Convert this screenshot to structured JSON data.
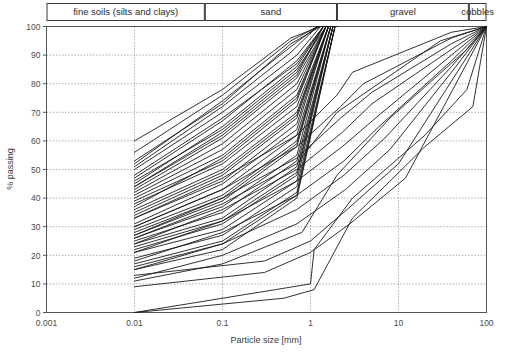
{
  "chart_data": {
    "type": "line",
    "title": "",
    "subtitle": "",
    "xlabel": "Particle size [mm]",
    "ylabel": "% passing",
    "xscale": "log",
    "xlim": [
      0.001,
      100
    ],
    "ylim": [
      0,
      100
    ],
    "xticks": [
      "0.001",
      "0.01",
      "0.1",
      "1",
      "10",
      "100"
    ],
    "xtick_values": [
      0.001,
      0.01,
      0.1,
      1,
      10,
      100
    ],
    "yticks": [
      "0",
      "10",
      "20",
      "30",
      "40",
      "50",
      "60",
      "70",
      "80",
      "90",
      "100"
    ],
    "ytick_values": [
      0,
      10,
      20,
      30,
      40,
      50,
      60,
      70,
      80,
      90,
      100
    ],
    "grid": "dotted-both",
    "legend": "none",
    "line_color": "#1a1a1a",
    "grid_color": "#9a9a9a",
    "axis_color": "#555555",
    "classification_bands": [
      {
        "label": "fine soils (silts and clays)",
        "x_start": 0.001,
        "x_end": 0.063
      },
      {
        "label": "sand",
        "x_start": 0.063,
        "x_end": 2.0
      },
      {
        "label": "gravel",
        "x_start": 2.0,
        "x_end": 63.0
      },
      {
        "label": "cobbles",
        "x_start": 63.0,
        "x_end": 200.0
      }
    ],
    "series": [
      {
        "name": "sample-01",
        "x": [
          0.01,
          0.1,
          0.6,
          1.3,
          2.0
        ],
        "y": [
          60,
          78,
          96,
          100,
          100
        ]
      },
      {
        "name": "sample-02",
        "x": [
          0.01,
          0.1,
          0.6,
          1.2,
          2.0
        ],
        "y": [
          52,
          74,
          93,
          100,
          100
        ]
      },
      {
        "name": "sample-03",
        "x": [
          0.01,
          0.1,
          0.6,
          1.2,
          2.0
        ],
        "y": [
          51,
          72,
          91,
          100,
          100
        ]
      },
      {
        "name": "sample-04",
        "x": [
          0.01,
          0.1,
          0.7,
          1.3,
          2.0
        ],
        "y": [
          50,
          70,
          90,
          100,
          100
        ]
      },
      {
        "name": "sample-05",
        "x": [
          0.01,
          0.1,
          0.7,
          1.4,
          2.0
        ],
        "y": [
          47,
          67,
          88,
          100,
          100
        ]
      },
      {
        "name": "sample-06",
        "x": [
          0.01,
          0.1,
          0.7,
          1.4,
          2.0
        ],
        "y": [
          45,
          65,
          86,
          100,
          100
        ]
      },
      {
        "name": "sample-07",
        "x": [
          0.01,
          0.1,
          0.7,
          1.4,
          2.0
        ],
        "y": [
          44,
          63,
          84,
          100,
          100
        ]
      },
      {
        "name": "sample-08",
        "x": [
          0.01,
          0.1,
          0.7,
          1.5,
          2.0
        ],
        "y": [
          43,
          61,
          82,
          100,
          100
        ]
      },
      {
        "name": "sample-09",
        "x": [
          0.01,
          0.1,
          0.7,
          1.5,
          2.0
        ],
        "y": [
          42,
          59,
          80,
          100,
          100
        ]
      },
      {
        "name": "sample-10",
        "x": [
          0.01,
          0.1,
          0.7,
          1.5,
          2.0
        ],
        "y": [
          41,
          57,
          78,
          100,
          100
        ]
      },
      {
        "name": "sample-11",
        "x": [
          0.01,
          0.1,
          0.7,
          1.5,
          2.0
        ],
        "y": [
          40,
          55,
          76,
          100,
          100
        ]
      },
      {
        "name": "sample-12",
        "x": [
          0.01,
          0.1,
          0.7,
          1.5,
          2.0
        ],
        "y": [
          39,
          53,
          74,
          100,
          100
        ]
      },
      {
        "name": "sample-13",
        "x": [
          0.01,
          0.1,
          0.7,
          1.6,
          2.0
        ],
        "y": [
          38,
          52,
          72,
          100,
          100
        ]
      },
      {
        "name": "sample-14",
        "x": [
          0.01,
          0.1,
          0.7,
          1.6,
          2.0
        ],
        "y": [
          36,
          50,
          70,
          100,
          100
        ]
      },
      {
        "name": "sample-15",
        "x": [
          0.01,
          0.1,
          0.7,
          1.6,
          2.0
        ],
        "y": [
          34,
          48,
          68,
          100,
          100
        ]
      },
      {
        "name": "sample-16",
        "x": [
          0.01,
          0.1,
          0.7,
          1.6,
          2.0
        ],
        "y": [
          33,
          46,
          66,
          100,
          100
        ]
      },
      {
        "name": "sample-17",
        "x": [
          0.01,
          0.1,
          0.7,
          1.6,
          2.0
        ],
        "y": [
          31,
          45,
          64,
          100,
          100
        ]
      },
      {
        "name": "sample-18",
        "x": [
          0.01,
          0.1,
          0.7,
          1.7,
          2.0
        ],
        "y": [
          30,
          43,
          62,
          100,
          100
        ]
      },
      {
        "name": "sample-19",
        "x": [
          0.01,
          0.1,
          0.7,
          1.7,
          2.0
        ],
        "y": [
          29,
          41,
          60,
          100,
          100
        ]
      },
      {
        "name": "sample-20",
        "x": [
          0.01,
          0.1,
          0.7,
          1.7,
          2.0
        ],
        "y": [
          27,
          39,
          58,
          100,
          100
        ]
      },
      {
        "name": "sample-21",
        "x": [
          0.01,
          0.1,
          0.7,
          1.7,
          2.0
        ],
        "y": [
          26,
          37,
          55,
          100,
          100
        ]
      },
      {
        "name": "sample-22",
        "x": [
          0.01,
          0.1,
          0.7,
          1.8,
          2.0
        ],
        "y": [
          25,
          35,
          53,
          100,
          100
        ]
      },
      {
        "name": "sample-23",
        "x": [
          0.01,
          0.1,
          0.7,
          1.8,
          2.0
        ],
        "y": [
          24,
          33,
          51,
          100,
          100
        ]
      },
      {
        "name": "sample-24",
        "x": [
          0.01,
          0.1,
          0.7,
          1.8,
          2.0
        ],
        "y": [
          22,
          31,
          48,
          100,
          100
        ]
      },
      {
        "name": "sample-25",
        "x": [
          0.01,
          0.1,
          0.7,
          1.8,
          2.0
        ],
        "y": [
          21,
          29,
          46,
          100,
          100
        ]
      },
      {
        "name": "sample-26",
        "x": [
          0.01,
          0.1,
          0.7,
          1.9,
          2.0
        ],
        "y": [
          19,
          27,
          44,
          100,
          100
        ]
      },
      {
        "name": "sample-27",
        "x": [
          0.01,
          0.1,
          0.7,
          1.9,
          2.0
        ],
        "y": [
          17,
          25,
          42,
          100,
          100
        ]
      },
      {
        "name": "sample-28",
        "x": [
          0.01,
          0.1,
          0.7,
          1.9,
          2.0
        ],
        "y": [
          15,
          22,
          40,
          100,
          100
        ]
      },
      {
        "name": "sample-29",
        "x": [
          0.01,
          0.1,
          0.7,
          2.0,
          3.0,
          40.0,
          100.0
        ],
        "y": [
          33,
          47,
          62,
          76,
          84,
          98,
          100
        ]
      },
      {
        "name": "sample-30",
        "x": [
          0.01,
          0.1,
          0.7,
          2.2,
          4.0,
          40.0,
          100.0
        ],
        "y": [
          30,
          43,
          58,
          72,
          80,
          96,
          100
        ]
      },
      {
        "name": "sample-31",
        "x": [
          0.01,
          0.1,
          0.7,
          2.2,
          5.0,
          40.0,
          100.0
        ],
        "y": [
          27,
          40,
          54,
          68,
          77,
          94,
          100
        ]
      },
      {
        "name": "sample-32",
        "x": [
          0.01,
          0.1,
          0.7,
          2.3,
          5.0,
          40.0,
          100.0
        ],
        "y": [
          24,
          36,
          50,
          63,
          73,
          92,
          100
        ]
      },
      {
        "name": "sample-33",
        "x": [
          0.01,
          0.1,
          0.7,
          2.3,
          6.0,
          40.0,
          100.0
        ],
        "y": [
          21,
          32,
          46,
          58,
          69,
          90,
          100
        ]
      },
      {
        "name": "sample-34",
        "x": [
          0.01,
          0.1,
          0.7,
          2.4,
          6.0,
          40.0,
          100.0
        ],
        "y": [
          18,
          28,
          41,
          53,
          65,
          88,
          100
        ]
      },
      {
        "name": "sample-35",
        "x": [
          0.01,
          0.1,
          0.7,
          2.4,
          7.0,
          40.0,
          100.0
        ],
        "y": [
          15,
          24,
          36,
          48,
          61,
          86,
          100
        ]
      },
      {
        "name": "sample-36",
        "x": [
          0.01,
          0.1,
          0.7,
          2.5,
          8.0,
          40.0,
          100.0
        ],
        "y": [
          12,
          20,
          31,
          43,
          57,
          84,
          100
        ]
      },
      {
        "name": "sample-37",
        "x": [
          0.01,
          0.3,
          1.0,
          2.6,
          10.0,
          100.0
        ],
        "y": [
          13,
          18,
          25,
          36,
          52,
          100
        ]
      },
      {
        "name": "sample-38",
        "x": [
          0.01,
          0.3,
          1.0,
          2.8,
          12.0,
          100.0
        ],
        "y": [
          9,
          14,
          21,
          31,
          47,
          100
        ]
      },
      {
        "name": "sample-39",
        "x": [
          0.01,
          0.4,
          1.0,
          1.1,
          3.0,
          20.0,
          60.0,
          100.0
        ],
        "y": [
          0,
          8,
          10,
          22,
          40,
          62,
          78,
          100
        ]
      },
      {
        "name": "sample-40",
        "x": [
          0.01,
          0.5,
          1.1,
          3.0,
          20.0,
          70.0,
          100.0
        ],
        "y": [
          0,
          5,
          8,
          33,
          58,
          72,
          100
        ]
      },
      {
        "name": "sample-41",
        "x": [
          0.01,
          0.1,
          0.8,
          2.0,
          8.0,
          60.0,
          100.0
        ],
        "y": [
          11,
          17,
          28,
          48,
          68,
          92,
          100
        ]
      },
      {
        "name": "sample-42",
        "x": [
          0.01,
          0.1,
          0.7,
          1.6,
          2.0
        ],
        "y": [
          35,
          49,
          69,
          100,
          100
        ]
      },
      {
        "name": "sample-43",
        "x": [
          0.01,
          0.1,
          0.7,
          1.5,
          2.0
        ],
        "y": [
          46,
          64,
          85,
          100,
          100
        ]
      },
      {
        "name": "sample-44",
        "x": [
          0.01,
          0.1,
          0.6,
          1.3,
          2.0
        ],
        "y": [
          53,
          73,
          94,
          100,
          100
        ]
      },
      {
        "name": "sample-45",
        "x": [
          0.01,
          0.1,
          0.7,
          1.4,
          2.0
        ],
        "y": [
          48,
          68,
          87,
          100,
          100
        ]
      },
      {
        "name": "sample-46",
        "x": [
          0.01,
          0.1,
          0.7,
          1.7,
          2.0
        ],
        "y": [
          28,
          40,
          59,
          100,
          100
        ]
      },
      {
        "name": "sample-47",
        "x": [
          0.01,
          0.1,
          0.7,
          1.8,
          2.0
        ],
        "y": [
          23,
          32,
          49,
          100,
          100
        ]
      },
      {
        "name": "sample-48",
        "x": [
          0.01,
          0.1,
          0.7,
          1.5,
          2.0
        ],
        "y": [
          37,
          54,
          75,
          100,
          100
        ]
      },
      {
        "name": "sample-49",
        "x": [
          0.01,
          0.1,
          0.7,
          1.9,
          2.0
        ],
        "y": [
          16,
          24,
          41,
          100,
          100
        ]
      },
      {
        "name": "sample-50",
        "x": [
          0.01,
          0.1,
          0.7,
          1.4,
          2.0
        ],
        "y": [
          44,
          62,
          83,
          100,
          100
        ]
      },
      {
        "name": "sample-51",
        "x": [
          0.01,
          0.1,
          0.6,
          1.2,
          2.0
        ],
        "y": [
          56,
          76,
          95,
          100,
          100
        ]
      },
      {
        "name": "sample-52",
        "x": [
          0.01,
          0.1,
          0.7,
          2.0,
          2.0,
          30.0,
          100.0
        ],
        "y": [
          26,
          38,
          52,
          70,
          70,
          95,
          100
        ]
      }
    ]
  },
  "axis": {
    "x_title": "Particle size [mm]",
    "y_title": "% passing"
  }
}
